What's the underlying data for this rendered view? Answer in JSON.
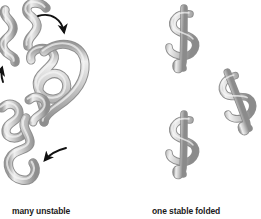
{
  "figure": {
    "type": "protein-folding-diagram",
    "background_color": "#ffffff",
    "chain_color_light": "#e8e8e8",
    "chain_color_mid": "#b4b4b4",
    "chain_color_dark": "#7a7a7a",
    "chain_outline": "#8a8a8a",
    "arrow_color": "#111111",
    "text_color": "#1a1a1a"
  },
  "panels": {
    "unfolded": {
      "caption": "many unstable",
      "shape_count": 5,
      "shape_kind": "unfolded-polymer-chain",
      "arrow_count": 3,
      "arrows": [
        {
          "name": "top-arrow",
          "direction": "down-right-curving-down"
        },
        {
          "name": "left-arrow",
          "direction": "up"
        },
        {
          "name": "bottom-arrow",
          "direction": "left"
        }
      ]
    },
    "folded": {
      "caption": "one stable folded",
      "shape_count": 3,
      "shape_kind": "folded-dollar-sign-conformation"
    }
  }
}
